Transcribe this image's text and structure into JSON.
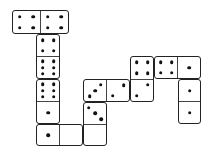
{
  "game": {
    "type": "dominoes",
    "dominoes": [
      {
        "id": "d1",
        "orientation": "h",
        "x": 12,
        "y": 10,
        "w": 57,
        "h": 24,
        "values": [
          4,
          4
        ]
      },
      {
        "id": "d2",
        "orientation": "v",
        "x": 36,
        "y": 34,
        "w": 24,
        "h": 45,
        "values": [
          4,
          6
        ]
      },
      {
        "id": "d3",
        "orientation": "v",
        "x": 36,
        "y": 79,
        "w": 24,
        "h": 45,
        "values": [
          6,
          1
        ]
      },
      {
        "id": "d4",
        "orientation": "h",
        "x": 36,
        "y": 124,
        "w": 47,
        "h": 22,
        "values": [
          1,
          0
        ]
      },
      {
        "id": "d5",
        "orientation": "h",
        "x": 83,
        "y": 79,
        "w": 47,
        "h": 23,
        "values": [
          3,
          2
        ]
      },
      {
        "id": "d6",
        "orientation": "v",
        "x": 83,
        "y": 102,
        "w": 24,
        "h": 44,
        "values": [
          3,
          0
        ]
      },
      {
        "id": "d7",
        "orientation": "v",
        "x": 130,
        "y": 56,
        "w": 24,
        "h": 46,
        "values": [
          4,
          2
        ]
      },
      {
        "id": "d8",
        "orientation": "h",
        "x": 154,
        "y": 56,
        "w": 47,
        "h": 23,
        "values": [
          4,
          1
        ]
      },
      {
        "id": "d9",
        "orientation": "v",
        "x": 178,
        "y": 79,
        "w": 23,
        "h": 45,
        "values": [
          1,
          1
        ]
      }
    ]
  }
}
